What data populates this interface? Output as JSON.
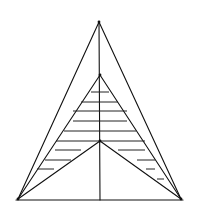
{
  "diagram": {
    "type": "geometric-figure",
    "colors": {
      "line": "#111111",
      "background": "#ffffff"
    },
    "points": {
      "A": [
        99,
        22
      ],
      "B": [
        18,
        199
      ],
      "C": [
        181,
        199
      ],
      "D": [
        100,
        75
      ],
      "E": [
        100,
        141
      ],
      "F": [
        100,
        200
      ]
    },
    "segments": [
      {
        "name": "outer-left-side",
        "from": "A",
        "to": "B"
      },
      {
        "name": "outer-right-side",
        "from": "A",
        "to": "C"
      },
      {
        "name": "base",
        "from": [
          16,
          200
        ],
        "to": [
          183,
          200
        ]
      },
      {
        "name": "inner-left-side",
        "from": "D",
        "to": "B"
      },
      {
        "name": "inner-right-side",
        "from": "D",
        "to": "C"
      },
      {
        "name": "center-left",
        "from": "E",
        "to": "B"
      },
      {
        "name": "center-right",
        "from": "E",
        "to": "C"
      },
      {
        "name": "vertical-median",
        "from": "A",
        "to": "F"
      }
    ],
    "hatch_lines": [
      {
        "y": 92,
        "x1": 91,
        "x2": 109
      },
      {
        "y": 102,
        "x1": 81,
        "x2": 118
      },
      {
        "y": 111,
        "x1": 73,
        "x2": 127
      },
      {
        "y": 121,
        "x1": 73,
        "x2": 127
      },
      {
        "y": 131,
        "x1": 64,
        "x2": 136
      },
      {
        "y": 141,
        "x1": 56,
        "x2": 145
      },
      {
        "y": 150,
        "x1": 55,
        "x2": 81
      },
      {
        "y": 150,
        "x1": 118,
        "x2": 145
      },
      {
        "y": 160,
        "x1": 45,
        "x2": 71
      },
      {
        "y": 160,
        "x1": 137,
        "x2": 155
      },
      {
        "y": 169,
        "x1": 37,
        "x2": 54
      },
      {
        "y": 169,
        "x1": 146,
        "x2": 155
      },
      {
        "y": 179,
        "x1": 157,
        "x2": 164
      }
    ]
  }
}
